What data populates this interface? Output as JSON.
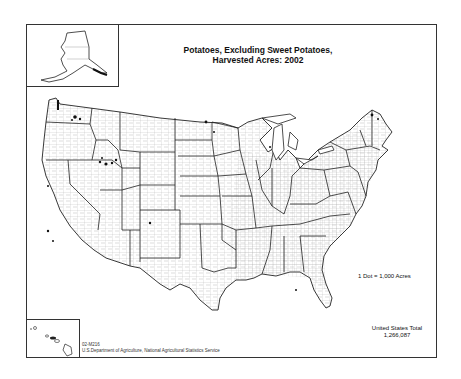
{
  "map": {
    "title_line1": "Potatoes, Excluding Sweet Potatoes,",
    "title_line2": "Harvested Acres:  2002",
    "legend": "1 Dot = 1,000 Acres",
    "total_label": "United States Total",
    "total_value": "1,266,087",
    "map_id": "02-M216",
    "source": "U.S.Department of Agriculture, National Agricultural Statistics Service",
    "insets": [
      "Alaska",
      "Hawaii"
    ],
    "colors": {
      "outline": "#222222",
      "county": "#8a8a8a",
      "dots": "#111111",
      "background": "#ffffff"
    }
  }
}
